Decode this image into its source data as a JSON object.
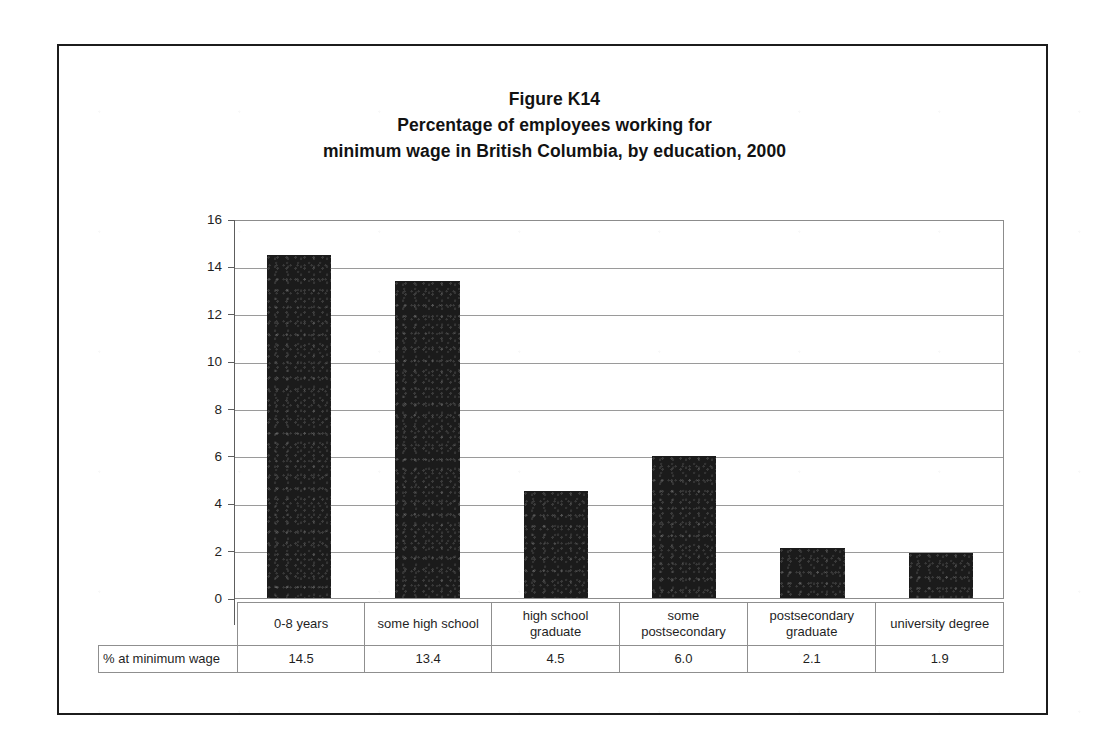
{
  "figure": {
    "title_lines": [
      "Figure K14",
      "Percentage of employees working for",
      "minimum wage in British Columbia, by education, 2000"
    ]
  },
  "chart_data": {
    "type": "bar",
    "xlabel": "",
    "ylabel": "",
    "ylim": [
      0,
      16
    ],
    "yticks": [
      0,
      2,
      4,
      6,
      8,
      10,
      12,
      14,
      16
    ],
    "ytick_labels": [
      "0",
      "2",
      "4",
      "6",
      "8",
      "10",
      "12",
      "14",
      "16"
    ],
    "grid": true,
    "legend": false,
    "bar_color": "#1b1b1b",
    "categories": [
      "0-8 years",
      "some high school",
      "high school graduate",
      "some postsecondary",
      "postsecondary graduate",
      "university degree"
    ],
    "category_lines": [
      [
        "0-8 years"
      ],
      [
        "some high school"
      ],
      [
        "high school",
        "graduate"
      ],
      [
        "some",
        "postsecondary"
      ],
      [
        "postsecondary",
        "graduate"
      ],
      [
        "university degree"
      ]
    ],
    "series": [
      {
        "name": "% at minimum wage",
        "values": [
          14.5,
          13.4,
          4.5,
          6.0,
          2.1,
          1.9
        ],
        "value_labels": [
          "14.5",
          "13.4",
          "4.5",
          "6.0",
          "2.1",
          "1.9"
        ]
      }
    ]
  },
  "data_table": {
    "row_header": "% at minimum wage",
    "values": [
      "14.5",
      "13.4",
      "4.5",
      "6.0",
      "2.1",
      "1.9"
    ]
  }
}
